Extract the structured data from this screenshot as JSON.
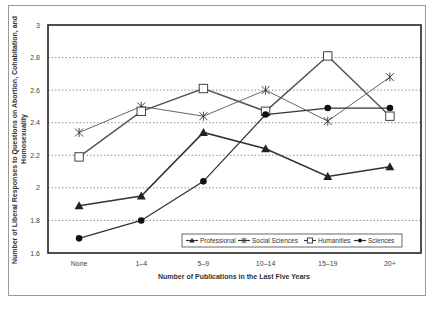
{
  "chart_data": {
    "type": "line",
    "title": "",
    "xlabel": "Number of Publications in the Last Five Years",
    "ylabel": "Number of Liberal Responses to Questions on Abortion, Cohabitation, and Homosexuality",
    "categories": [
      "None",
      "1–4",
      "5–9",
      "10–14",
      "15–19",
      "20+"
    ],
    "ylim": [
      1.6,
      3.0
    ],
    "yticks": [
      "1.6",
      "1.8",
      "2",
      "2.2",
      "2.4",
      "2.6",
      "2.8",
      "3"
    ],
    "grid": "horizontal dotted",
    "legend_position": "bottom-right inside plot",
    "series": [
      {
        "name": "Professional",
        "marker": "triangle",
        "values": [
          1.89,
          1.95,
          2.34,
          2.24,
          2.07,
          2.13
        ]
      },
      {
        "name": "Social Sciences",
        "marker": "asterisk",
        "values": [
          2.34,
          2.5,
          2.44,
          2.6,
          2.41,
          2.68
        ]
      },
      {
        "name": "Humanities",
        "marker": "open-square",
        "values": [
          2.19,
          2.47,
          2.61,
          2.47,
          2.81,
          2.44
        ]
      },
      {
        "name": "Sciences",
        "marker": "filled-circle",
        "values": [
          1.69,
          1.8,
          2.04,
          2.45,
          2.49,
          2.49
        ]
      }
    ]
  }
}
